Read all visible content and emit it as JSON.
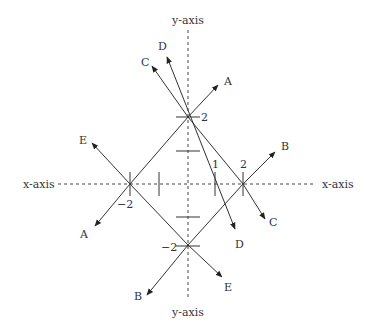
{
  "diagram": {
    "axes": {
      "x_label_left": "x-axis",
      "x_label_right": "x-axis",
      "y_label_top": "y-axis",
      "y_label_bottom": "y-axis"
    },
    "tick_labels": {
      "y_pos_2": "2",
      "y_neg_2": "−2",
      "x_pos_1": "1",
      "x_pos_2": "2",
      "x_neg_2": "−2"
    },
    "vectors": [
      {
        "name": "A",
        "direction": "up-right",
        "label": "A"
      },
      {
        "name": "A",
        "direction": "down-left",
        "label": "A"
      },
      {
        "name": "B",
        "direction": "up-right",
        "label": "B"
      },
      {
        "name": "B",
        "direction": "down-left",
        "label": "B"
      },
      {
        "name": "C",
        "direction": "up-left",
        "label": "C"
      },
      {
        "name": "C",
        "direction": "down-right",
        "label": "C"
      },
      {
        "name": "D",
        "direction": "up-left",
        "label": "D"
      },
      {
        "name": "D",
        "direction": "down-right",
        "label": "D"
      },
      {
        "name": "E",
        "direction": "up-left",
        "label": "E"
      },
      {
        "name": "E",
        "direction": "down-right",
        "label": "E"
      }
    ],
    "colors": {
      "line": "#333333",
      "axis": "#444444",
      "background": "#ffffff"
    }
  }
}
